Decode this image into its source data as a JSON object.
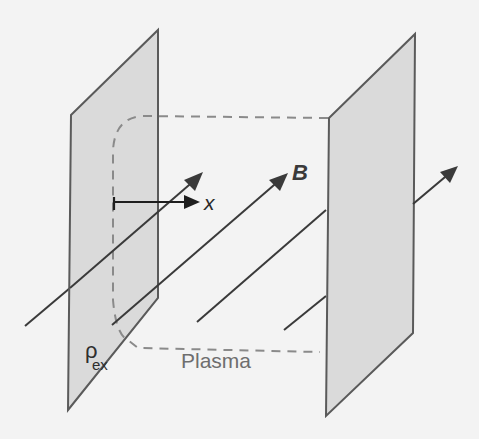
{
  "figure": {
    "labels": {
      "magnetic_field": "B",
      "axis": "x",
      "charge_density_symbol": "ρ",
      "charge_density_subscript": "ex",
      "region": "Plasma"
    },
    "colors": {
      "background": "#f3f3f3",
      "plate_fill": "#dadada",
      "plate_stroke": "#5a5a5a",
      "field_line": "#3a3a3a",
      "plasma_boundary": "#8a8a8a"
    }
  }
}
